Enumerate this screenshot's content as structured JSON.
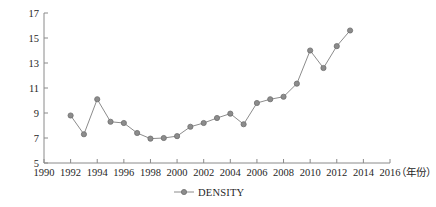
{
  "chart_data": {
    "type": "line",
    "title": "",
    "subtitle": "",
    "xlabel": "（年份）",
    "ylabel": "",
    "xlim": [
      1990,
      2016
    ],
    "ylim": [
      5,
      17
    ],
    "grid": false,
    "legend_position": "bottom-center",
    "x_ticks": [
      "1990",
      "1992",
      "1994",
      "1996",
      "1998",
      "2000",
      "2002",
      "2004",
      "2006",
      "2008",
      "2010",
      "2012",
      "2014",
      "2016"
    ],
    "x_tick_values": [
      1990,
      1992,
      1994,
      1996,
      1998,
      2000,
      2002,
      2004,
      2006,
      2008,
      2010,
      2012,
      2014,
      2016
    ],
    "y_ticks": [
      "5",
      "7",
      "9",
      "11",
      "13",
      "15",
      "17"
    ],
    "y_tick_values": [
      5,
      7,
      9,
      11,
      13,
      15,
      17
    ],
    "x": [
      1992,
      1993,
      1994,
      1995,
      1996,
      1997,
      1998,
      1999,
      2000,
      2001,
      2002,
      2003,
      2004,
      2005,
      2006,
      2007,
      2008,
      2009,
      2010,
      2011,
      2012,
      2013
    ],
    "series": [
      {
        "name": "DENSITY",
        "values": [
          8.8,
          7.3,
          10.1,
          8.3,
          8.2,
          7.4,
          6.95,
          7.0,
          7.15,
          7.9,
          8.2,
          8.6,
          8.95,
          8.1,
          9.8,
          10.1,
          10.3,
          11.35,
          14.0,
          12.6,
          14.35,
          15.6
        ],
        "color": "#8c8c8c",
        "marker": "circle"
      }
    ]
  },
  "legend": {
    "entries": [
      {
        "label": "DENSITY",
        "color": "#8c8c8c"
      }
    ]
  },
  "axis": {
    "unit_label": "（年份）",
    "line_color": "#8a8a8a"
  }
}
